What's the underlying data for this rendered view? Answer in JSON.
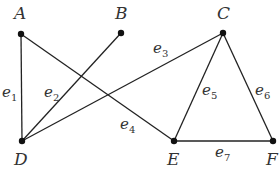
{
  "graph": {
    "vertices": [
      {
        "id": "A",
        "label": "A",
        "x": 21,
        "y": 34,
        "lx": 14,
        "ly": 19
      },
      {
        "id": "B",
        "label": "B",
        "x": 121,
        "y": 33,
        "lx": 115,
        "ly": 19
      },
      {
        "id": "C",
        "label": "C",
        "x": 223,
        "y": 33,
        "lx": 217,
        "ly": 19
      },
      {
        "id": "D",
        "label": "D",
        "x": 22,
        "y": 141,
        "lx": 14,
        "ly": 165
      },
      {
        "id": "E",
        "label": "E",
        "x": 174,
        "y": 141,
        "lx": 167,
        "ly": 165
      },
      {
        "id": "F",
        "label": "F",
        "x": 273,
        "y": 141,
        "lx": 266,
        "ly": 165
      }
    ],
    "edges": [
      {
        "id": "e1",
        "name": "e",
        "sub": "1",
        "from": "A",
        "to": "D",
        "lx": 2,
        "ly": 97
      },
      {
        "id": "e2",
        "name": "e",
        "sub": "2",
        "from": "B",
        "to": "D",
        "lx": 44,
        "ly": 97
      },
      {
        "id": "e3",
        "name": "e",
        "sub": "3",
        "from": "C",
        "to": "D",
        "lx": 153,
        "ly": 53
      },
      {
        "id": "e4",
        "name": "e",
        "sub": "4",
        "from": "A",
        "to": "E",
        "lx": 120,
        "ly": 129
      },
      {
        "id": "e5",
        "name": "e",
        "sub": "5",
        "from": "C",
        "to": "E",
        "lx": 202,
        "ly": 95
      },
      {
        "id": "e6",
        "name": "e",
        "sub": "6",
        "from": "C",
        "to": "F",
        "lx": 255,
        "ly": 95
      },
      {
        "id": "e7",
        "name": "e",
        "sub": "7",
        "from": "E",
        "to": "F",
        "lx": 215,
        "ly": 157
      }
    ]
  }
}
